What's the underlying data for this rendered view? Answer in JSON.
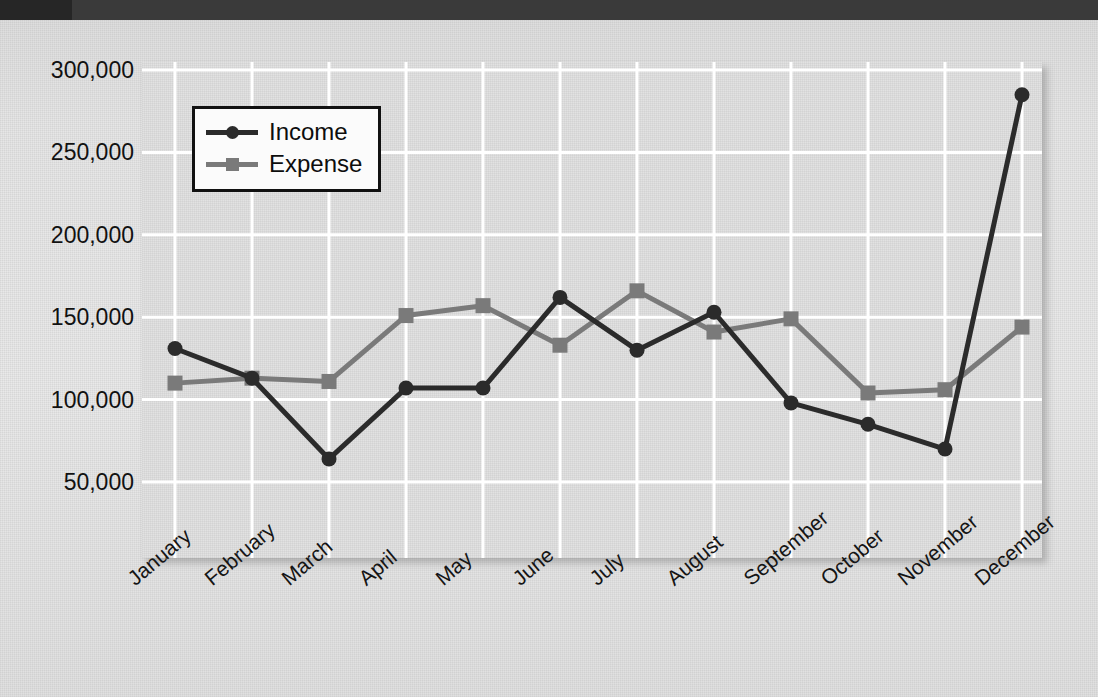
{
  "slide": {
    "top_band_color": "#3a3a3a",
    "top_band_accent_color": "#262626",
    "background_color": "#e4e4e4"
  },
  "chart_panel": {
    "background_color": "#e2e2e2",
    "gridline_color": "#ffffff"
  },
  "legend": {
    "position": "inside-top-left",
    "entries": [
      {
        "label": "Income",
        "color": "#2b2b2b",
        "marker": "circle"
      },
      {
        "label": "Expense",
        "color": "#7a7a7a",
        "marker": "square"
      }
    ]
  },
  "chart_data": {
    "type": "line",
    "title": "",
    "subtitle": "",
    "xlabel": "",
    "ylabel": "",
    "grid": true,
    "legend_position": "inside-top-left",
    "categories": [
      "January",
      "February",
      "March",
      "April",
      "May",
      "June",
      "July",
      "August",
      "September",
      "October",
      "November",
      "December"
    ],
    "ylim": [
      0,
      310000
    ],
    "ytick_values": [
      50000,
      100000,
      150000,
      200000,
      250000,
      300000
    ],
    "ytick_labels": [
      "50,000",
      "100,000",
      "150,000",
      "200,000",
      "250,000",
      "300,000"
    ],
    "series": [
      {
        "name": "Income",
        "color": "#2b2b2b",
        "marker": "circle",
        "values": [
          131000,
          113000,
          64000,
          107000,
          107000,
          162000,
          130000,
          153000,
          98000,
          85000,
          70000,
          285000
        ]
      },
      {
        "name": "Expense",
        "color": "#7a7a7a",
        "marker": "square",
        "values": [
          110000,
          113000,
          111000,
          151000,
          157000,
          133000,
          166000,
          141000,
          149000,
          104000,
          106000,
          144000
        ]
      }
    ]
  }
}
